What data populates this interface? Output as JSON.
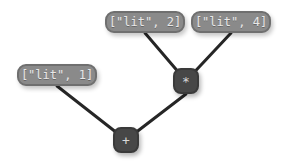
{
  "graph": {
    "title": "expression-tree",
    "background_color": "#ffffff",
    "literal_node_color": "#8a8a8a",
    "literal_text_color": "#e8e8e8",
    "operator_node_color": "#474747",
    "operator_text_color": "#d8d8d8",
    "edge_color": "#262626",
    "nodes": [
      {
        "id": "lit2",
        "type": "literal",
        "label": "[\"lit\", 2]",
        "x": 105,
        "y": 11,
        "width": 80,
        "height": 22
      },
      {
        "id": "lit4",
        "type": "literal",
        "label": "[\"lit\", 4]",
        "x": 191,
        "y": 11,
        "width": 80,
        "height": 22
      },
      {
        "id": "lit1",
        "type": "literal",
        "label": "[\"lit\", 1]",
        "x": 17,
        "y": 64,
        "width": 80,
        "height": 22
      },
      {
        "id": "mul",
        "type": "operator",
        "label": "*",
        "x": 173,
        "y": 68,
        "width": 26,
        "height": 26
      },
      {
        "id": "add",
        "type": "operator",
        "label": "+",
        "x": 113,
        "y": 127,
        "width": 26,
        "height": 26
      }
    ],
    "edges": [
      {
        "id": "edge-lit2-mul",
        "from": "lit2",
        "to": "mul",
        "x1": 145,
        "y1": 33,
        "x2": 186,
        "y2": 81
      },
      {
        "id": "edge-lit4-mul",
        "from": "lit4",
        "to": "mul",
        "x1": 231,
        "y1": 33,
        "x2": 186,
        "y2": 81
      },
      {
        "id": "edge-lit1-add",
        "from": "lit1",
        "to": "add",
        "x1": 57,
        "y1": 86,
        "x2": 126,
        "y2": 140
      },
      {
        "id": "edge-mul-add",
        "from": "mul",
        "to": "add",
        "x1": 186,
        "y1": 94,
        "x2": 126,
        "y2": 140
      }
    ]
  }
}
